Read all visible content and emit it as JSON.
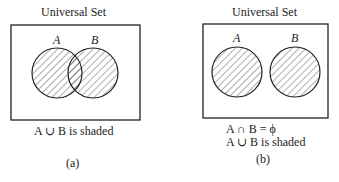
{
  "panels": [
    {
      "title": "Universal Set",
      "set_a": "A",
      "set_b": "B",
      "caption_lines": [
        "A ∪ B is shaded"
      ],
      "label": "(a)"
    },
    {
      "title": "Universal Set",
      "set_a": "A",
      "set_b": "B",
      "caption_lines": [
        "A ∩ B = ϕ",
        "A ∪ B is shaded"
      ],
      "label": "(b)"
    }
  ],
  "colors": {
    "stroke": "#222222",
    "hatch": "#333333",
    "background": "#ffffff"
  }
}
